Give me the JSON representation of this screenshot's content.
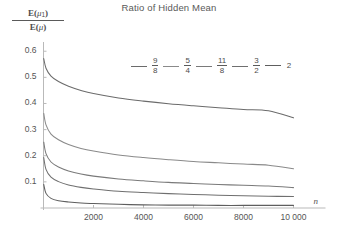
{
  "chart_data": {
    "type": "line",
    "title": "Ratio of Hidden Mean",
    "xlabel": "n",
    "ylabel": "E(μ₁) / E(μ)",
    "xlim": [
      0,
      10000
    ],
    "ylim": [
      0,
      0.62
    ],
    "grid": false,
    "legend_position": "top-center",
    "xticks": [
      2000,
      4000,
      6000,
      8000,
      10000
    ],
    "xtick_labels": [
      "2000",
      "4000",
      "6000",
      "8000",
      "10 000"
    ],
    "yticks": [
      0.1,
      0.2,
      0.3,
      0.4,
      0.5,
      0.6
    ],
    "ytick_labels": [
      "0.1",
      "0.2",
      "0.3",
      "0.4",
      "0.5",
      "0.6"
    ],
    "x": [
      10,
      100,
      300,
      600,
      1000,
      1500,
      2000,
      3000,
      4000,
      5000,
      6000,
      7000,
      8000,
      9000,
      10000
    ],
    "series": [
      {
        "name": "9/8",
        "numerator": "9",
        "denominator": "8",
        "color": "#6b6b6b",
        "values": [
          0.572,
          0.535,
          0.505,
          0.484,
          0.466,
          0.45,
          0.438,
          0.421,
          0.409,
          0.399,
          0.391,
          0.384,
          0.377,
          0.372,
          0.345
        ]
      },
      {
        "name": "5/4",
        "numerator": "5",
        "denominator": "4",
        "color": "#8a8a8a",
        "values": [
          0.362,
          0.318,
          0.283,
          0.261,
          0.243,
          0.228,
          0.218,
          0.203,
          0.193,
          0.185,
          0.178,
          0.173,
          0.168,
          0.164,
          0.15
        ]
      },
      {
        "name": "11/8",
        "numerator": "11",
        "denominator": "8",
        "color": "#7a7a7a",
        "values": [
          0.252,
          0.208,
          0.176,
          0.157,
          0.142,
          0.13,
          0.122,
          0.111,
          0.104,
          0.098,
          0.094,
          0.09,
          0.087,
          0.084,
          0.078
        ]
      },
      {
        "name": "3/2",
        "numerator": "3",
        "denominator": "2",
        "color": "#6f6f6f",
        "values": [
          0.193,
          0.148,
          0.118,
          0.101,
          0.088,
          0.079,
          0.073,
          0.064,
          0.059,
          0.055,
          0.052,
          0.049,
          0.047,
          0.045,
          0.044
        ]
      },
      {
        "name": "2",
        "numerator": "2",
        "denominator": "",
        "color": "#5e5e5e",
        "values": [
          0.09,
          0.056,
          0.037,
          0.028,
          0.023,
          0.019,
          0.017,
          0.014,
          0.012,
          0.011,
          0.011,
          0.01,
          0.01,
          0.01,
          0.01
        ]
      }
    ]
  },
  "axis": {
    "y_label_numerator_prefix": "E(",
    "y_label_numerator_var": "μ",
    "y_label_numerator_sub": "1",
    "y_label_numerator_suffix": ")",
    "y_label_denominator_prefix": "E(",
    "y_label_denominator_var": "μ",
    "y_label_denominator_suffix": ")",
    "x_axis_name": "n"
  }
}
